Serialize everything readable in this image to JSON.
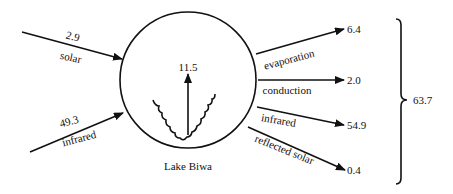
{
  "diagram": {
    "center_label": "Lake Biwa",
    "total": "63.7",
    "upward_flux": "11.5",
    "inputs": [
      {
        "name": "solar",
        "value": "2.9"
      },
      {
        "name": "infrared",
        "value": "49.3"
      }
    ],
    "outputs": [
      {
        "name": "evaporation",
        "value": "6.4"
      },
      {
        "name": "conduction",
        "value": "2.0"
      },
      {
        "name": "infrared",
        "value": "54.9"
      },
      {
        "name": "reflected solar",
        "value": "0.4"
      }
    ],
    "colors": {
      "stroke": "#111111",
      "background": "#ffffff"
    }
  }
}
